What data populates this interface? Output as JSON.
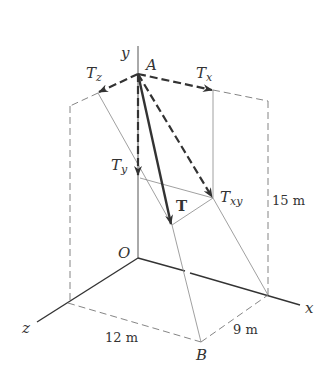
{
  "diagram": {
    "axes": {
      "x": "x",
      "y": "y",
      "z": "z",
      "origin": "O"
    },
    "points": {
      "A": "A",
      "B": "B"
    },
    "vectors": {
      "T": "T",
      "Tx": {
        "base": "T",
        "sub": "x"
      },
      "Ty": {
        "base": "T",
        "sub": "y"
      },
      "Tz": {
        "base": "T",
        "sub": "z"
      },
      "Txy": {
        "base": "T",
        "sub": "xy"
      }
    },
    "dimensions": {
      "height": "15 m",
      "z_extent": "12 m",
      "x_extent": "9 m"
    },
    "colors": {
      "line": "#333333",
      "light_line": "#888888"
    }
  }
}
